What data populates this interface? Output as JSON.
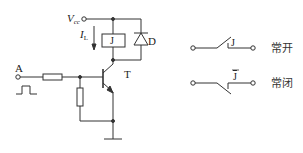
{
  "diagram": {
    "type": "relay-driver-circuit",
    "labels": {
      "supply": "V",
      "supply_sub": "cc",
      "current": "I",
      "current_sub": "L",
      "relay_coil": "J",
      "diode": "D",
      "transistor": "T",
      "input": "A"
    },
    "legend": [
      {
        "symbol_label": "J",
        "text": "常开",
        "kind": "normally-open"
      },
      {
        "symbol_label": "J",
        "text": "常闭",
        "kind": "normally-closed",
        "overbar": true
      }
    ],
    "colors": {
      "line": "#333333",
      "background": "#ffffff"
    }
  }
}
